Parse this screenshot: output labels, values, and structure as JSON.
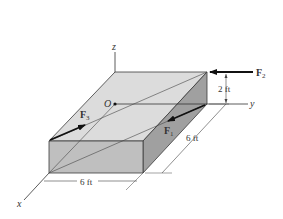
{
  "figure": {
    "axes": {
      "x": "x",
      "y": "y",
      "z": "z",
      "origin": "O"
    },
    "forces": [
      {
        "name": "F",
        "sub": "1"
      },
      {
        "name": "F",
        "sub": "2"
      },
      {
        "name": "F",
        "sub": "3"
      }
    ],
    "dimensions": {
      "height": "2 ft",
      "width_x": "6 ft",
      "length_y": "6 ft"
    },
    "colors": {
      "top_face": "#d9d9d9",
      "front_face": "#bdbdbd",
      "side_face": "#9a9a9a",
      "edge": "#3a3a3a",
      "arrow": "#111111"
    }
  }
}
